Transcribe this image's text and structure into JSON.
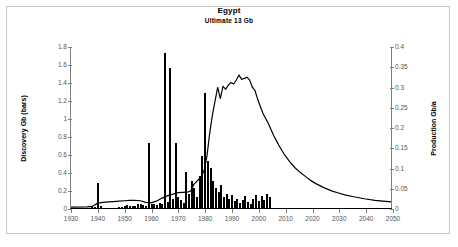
{
  "chart_data": {
    "type": "bar",
    "title": "Egypt",
    "subtitle": "Ultimate  13 Gb",
    "xlabel": "",
    "ylabel": "Discovery Gb (bars)",
    "y2label": "Production Gb/a",
    "xlim": [
      1930,
      2050
    ],
    "ylim": [
      0,
      1.8
    ],
    "y2lim": [
      0,
      0.4
    ],
    "grid": false,
    "legend": null,
    "xticks": [
      1930,
      1940,
      1950,
      1960,
      1970,
      1980,
      1990,
      2000,
      2010,
      2020,
      2030,
      2040,
      2050
    ],
    "yticks": [
      0,
      0.2,
      0.4,
      0.6,
      0.8,
      1,
      1.2,
      1.4,
      1.6,
      1.8
    ],
    "ytick_labels": [
      "0",
      "0.2",
      "0.4",
      "0.6",
      "0.8",
      "1",
      "1.2",
      "1.4",
      "1.6",
      "1.8"
    ],
    "y2ticks": [
      0,
      0.05,
      0.1,
      0.15,
      0.2,
      0.25,
      0.3,
      0.35,
      0.4
    ],
    "y2tick_labels": [
      "0",
      "0.05",
      "0.1",
      "0.15",
      "0.2",
      "0.25",
      "0.3",
      "0.35",
      "0.4"
    ],
    "series": [
      {
        "name": "Discovery Gb (bars)",
        "type": "bar",
        "axis": "left",
        "color": "#000000",
        "x": [
          1938,
          1939,
          1940,
          1941,
          1948,
          1949,
          1950,
          1951,
          1952,
          1953,
          1954,
          1955,
          1956,
          1957,
          1958,
          1959,
          1960,
          1961,
          1962,
          1963,
          1964,
          1965,
          1966,
          1967,
          1968,
          1969,
          1970,
          1971,
          1972,
          1973,
          1974,
          1975,
          1976,
          1977,
          1978,
          1979,
          1980,
          1981,
          1982,
          1983,
          1984,
          1985,
          1986,
          1987,
          1988,
          1989,
          1990,
          1991,
          1992,
          1993,
          1994,
          1995,
          1996,
          1997,
          1998,
          1999,
          2000,
          2001,
          2002,
          2003,
          2004
        ],
        "values": [
          0.02,
          0.01,
          0.28,
          0.02,
          0.01,
          0.01,
          0.02,
          0.03,
          0.02,
          0.02,
          0.02,
          0.04,
          0.05,
          0.03,
          0.02,
          0.72,
          0.04,
          0.05,
          0.03,
          0.06,
          0.05,
          1.72,
          0.07,
          1.56,
          0.1,
          0.72,
          0.12,
          0.09,
          0.06,
          0.4,
          0.16,
          0.3,
          0.22,
          0.12,
          0.36,
          0.58,
          1.28,
          0.52,
          0.44,
          0.3,
          0.22,
          0.18,
          0.26,
          0.12,
          0.16,
          0.1,
          0.14,
          0.08,
          0.1,
          0.06,
          0.09,
          0.13,
          0.07,
          0.05,
          0.1,
          0.14,
          0.08,
          0.13,
          0.09,
          0.16,
          0.12
        ]
      },
      {
        "name": "Production Gb/a",
        "type": "line",
        "axis": "right",
        "color": "#000000",
        "x": [
          1930,
          1936,
          1938,
          1940,
          1942,
          1944,
          1946,
          1948,
          1950,
          1952,
          1954,
          1956,
          1958,
          1960,
          1962,
          1964,
          1966,
          1968,
          1970,
          1972,
          1974,
          1975,
          1976,
          1977,
          1978,
          1979,
          1980,
          1981,
          1982,
          1983,
          1984,
          1985,
          1986,
          1987,
          1988,
          1989,
          1990,
          1991,
          1992,
          1993,
          1994,
          1995,
          1996,
          1997,
          1998,
          1999,
          2000,
          2002,
          2004,
          2006,
          2008,
          2010,
          2012,
          2014,
          2016,
          2018,
          2020,
          2022,
          2025,
          2028,
          2030,
          2033,
          2036,
          2040,
          2044,
          2047,
          2050
        ],
        "values": [
          0.002,
          0.003,
          0.004,
          0.012,
          0.014,
          0.015,
          0.016,
          0.017,
          0.018,
          0.019,
          0.019,
          0.018,
          0.014,
          0.013,
          0.017,
          0.024,
          0.03,
          0.034,
          0.038,
          0.039,
          0.04,
          0.043,
          0.058,
          0.065,
          0.072,
          0.08,
          0.095,
          0.13,
          0.185,
          0.23,
          0.265,
          0.3,
          0.272,
          0.302,
          0.295,
          0.305,
          0.312,
          0.308,
          0.318,
          0.33,
          0.32,
          0.322,
          0.325,
          0.318,
          0.3,
          0.292,
          0.27,
          0.235,
          0.21,
          0.18,
          0.155,
          0.133,
          0.115,
          0.1,
          0.088,
          0.078,
          0.068,
          0.06,
          0.05,
          0.042,
          0.038,
          0.032,
          0.028,
          0.023,
          0.019,
          0.017,
          0.015
        ]
      }
    ]
  }
}
